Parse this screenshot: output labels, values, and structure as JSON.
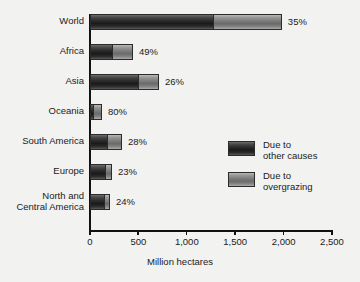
{
  "chart_data": {
    "type": "bar",
    "orientation": "horizontal",
    "stacked": true,
    "title": "",
    "xlabel": "Million hectares",
    "ylabel": "",
    "xlim": [
      0,
      2500
    ],
    "xticks": [
      0,
      500,
      1000,
      1500,
      2000,
      2500
    ],
    "xtick_labels": [
      "0",
      "500",
      "1,000",
      "1,500",
      "2,000",
      "2,500"
    ],
    "grid": false,
    "legend_position": "center-right",
    "categories": [
      "World",
      "Africa",
      "Asia",
      "Oceania",
      "South America",
      "Europe",
      "North and\nCentral America"
    ],
    "series": [
      {
        "name": "Due to other causes",
        "color": "#262626",
        "values": [
          1270,
          227,
          496,
          25,
          176,
          155,
          155
        ]
      },
      {
        "name": "Due to overgrazing",
        "color": "#878787",
        "values": [
          712,
          217,
          217,
          99,
          155,
          72,
          52
        ]
      }
    ],
    "totals": [
      1982,
      444,
      713,
      124,
      331,
      227,
      207
    ],
    "annotations": [
      "35%",
      "49%",
      "26%",
      "80%",
      "28%",
      "23%",
      "24%"
    ],
    "annotation_meaning": "Percent due to overgrazing"
  },
  "axis": {
    "x_title": "Million hectares",
    "ticks": [
      {
        "label": "0",
        "value": 0
      },
      {
        "label": "500",
        "value": 500
      },
      {
        "label": "1,000",
        "value": 1000
      },
      {
        "label": "1,500",
        "value": 1500
      },
      {
        "label": "2,000",
        "value": 2000
      },
      {
        "label": "2,500",
        "value": 2500
      }
    ]
  },
  "rows": [
    {
      "label": "World",
      "label_line2": "",
      "other": 1270,
      "over": 712,
      "pct": "35%"
    },
    {
      "label": "Africa",
      "label_line2": "",
      "other": 227,
      "over": 217,
      "pct": "49%"
    },
    {
      "label": "Asia",
      "label_line2": "",
      "other": 496,
      "over": 217,
      "pct": "26%"
    },
    {
      "label": "Oceania",
      "label_line2": "",
      "other": 25,
      "over": 99,
      "pct": "80%"
    },
    {
      "label": "South America",
      "label_line2": "",
      "other": 176,
      "over": 155,
      "pct": "28%"
    },
    {
      "label": "Europe",
      "label_line2": "",
      "other": 155,
      "over": 72,
      "pct": "23%"
    },
    {
      "label": "North and",
      "label_line2": "Central America",
      "other": 155,
      "over": 52,
      "pct": "24%"
    }
  ],
  "legend": {
    "items": [
      {
        "label": "Due to\nother causes",
        "color": "#262626"
      },
      {
        "label": "Due to\novergrazing",
        "color": "#878787"
      }
    ]
  }
}
